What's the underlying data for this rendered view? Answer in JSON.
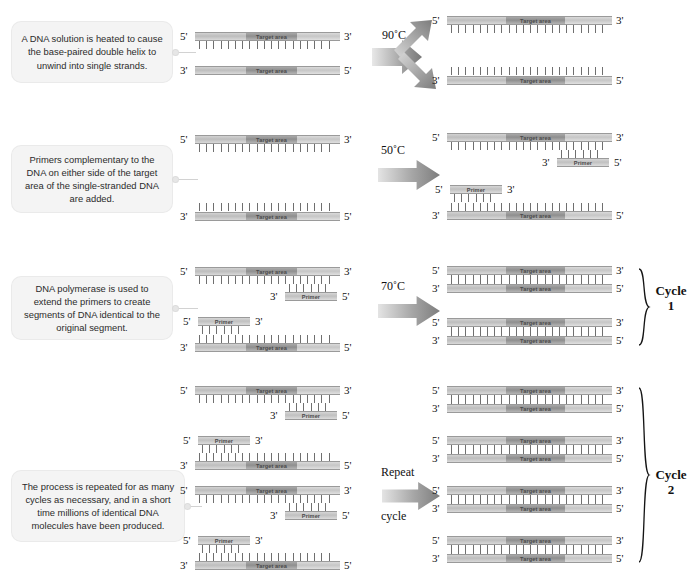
{
  "figure": {
    "labels": {
      "target_area": "Target area",
      "primer": "Primer",
      "five_prime": "5'",
      "three_prime": "3'"
    },
    "colors": {
      "callout_bg": "#f4f4f4",
      "flank": "#c8c8c8",
      "target": "#969696",
      "primer": "#cfcfcf",
      "teeth": "#6f6f6f",
      "arrow": "#9a9a9a",
      "text": "#111111"
    }
  },
  "steps": [
    {
      "id": "denature",
      "callout": "A DNA solution is heated to cause the base-paired double helix to unwind into single strands.",
      "arrow_label": "90˚C",
      "arrow_type": "split",
      "cycle_label": null
    },
    {
      "id": "anneal",
      "callout": "Primers complementary to the DNA on either side of the target area of the single-stranded DNA are added.",
      "arrow_label": "50˚C",
      "arrow_type": "straight",
      "cycle_label": null
    },
    {
      "id": "extend",
      "callout": "DNA polymerase is used to extend the primers to create segments of DNA identical to the original segment.",
      "arrow_label": "70˚C",
      "arrow_type": "straight",
      "cycle_label": {
        "word": "Cycle",
        "number": "1"
      }
    },
    {
      "id": "repeat",
      "callout": "The process is repeated for as many cycles as necessary, and in a short time millions of identical DNA molecules have been produced.",
      "arrow_label_top": "Repeat",
      "arrow_label_bottom": "cycle",
      "arrow_type": "straight",
      "cycle_label": {
        "word": "Cycle",
        "number": "2"
      }
    }
  ],
  "strand_labels": {
    "r1_left_top_5": "5'",
    "r1_left_top_3": "3'",
    "r1_left_bot_3": "3'",
    "r1_left_bot_5": "5'",
    "r1_right_a_5": "5'",
    "r1_right_a_3": "3'",
    "r1_right_b_3": "3'",
    "r1_right_b_5": "5'",
    "r2_left_top_5": "5'",
    "r2_left_top_3": "3'",
    "r2_left_bot_3": "3'",
    "r2_left_bot_5": "5'",
    "r2_right_top_5": "5'",
    "r2_right_top_3": "3'",
    "r2_right_primer1_3": "3'",
    "r2_right_primer1_5": "5'",
    "r2_right_primer2_5": "5'",
    "r2_right_primer2_3": "3'",
    "r2_right_bot_3": "3'",
    "r2_right_bot_5": "5'",
    "r3_left_top_5": "5'",
    "r3_left_top_3": "3'",
    "r3_left_p1_3": "3'",
    "r3_left_p1_5": "5'",
    "r3_left_p2_5": "5'",
    "r3_left_p2_3": "3'",
    "r3_left_bot_3": "3'",
    "r3_left_bot_5": "5'",
    "r3_right_1_5": "5'",
    "r3_right_1_3": "3'",
    "r3_right_2_3": "3'",
    "r3_right_2_5": "5'",
    "r3_right_3_5": "5'",
    "r3_right_3_3": "3'",
    "r3_right_4_3": "3'",
    "r3_right_4_5": "5'",
    "r4_left_1_5": "5'",
    "r4_left_1_3": "3'",
    "r4_left_p1_3": "3'",
    "r4_left_p1_5": "5'",
    "r4_left_p2_5": "5'",
    "r4_left_p2_3": "3'",
    "r4_left_2_3": "3'",
    "r4_left_2_5": "5'",
    "r4_left_3_5": "5'",
    "r4_left_3_3": "3'",
    "r4_left_p3_3": "3'",
    "r4_left_p3_5": "5'",
    "r4_left_p4_5": "5'",
    "r4_left_p4_3": "3'",
    "r4_left_4_3": "3'",
    "r4_left_4_5": "5'",
    "r4_right_1_5": "5'",
    "r4_right_1_3": "3'",
    "r4_right_2_3": "3'",
    "r4_right_2_5": "5'",
    "r4_right_3_5": "5'",
    "r4_right_3_3": "3'",
    "r4_right_4_3": "3'",
    "r4_right_4_5": "5'",
    "r4_right_5_5": "5'",
    "r4_right_5_3": "3'",
    "r4_right_6_3": "3'",
    "r4_right_6_5": "5'",
    "r4_right_7_5": "5'",
    "r4_right_7_3": "3'",
    "r4_right_8_3": "3'",
    "r4_right_8_5": "5'"
  }
}
